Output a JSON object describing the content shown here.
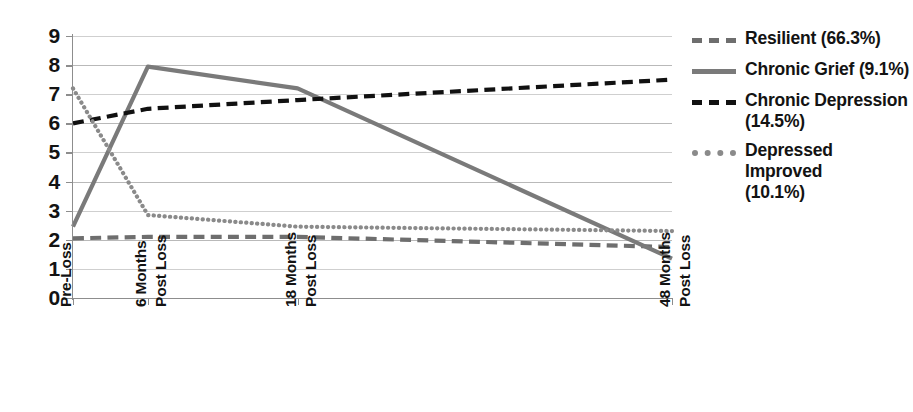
{
  "chart_data": {
    "type": "line",
    "title": "",
    "xlabel": "",
    "ylabel": "",
    "categories": [
      "Pre-Loss",
      "6 Months Post Loss",
      "18 Months Post Loss",
      "48 Months Post Loss"
    ],
    "x": [
      0,
      6,
      18,
      48
    ],
    "xlim": [
      0,
      48
    ],
    "ylim": [
      0,
      9
    ],
    "yticks": [
      "0",
      "1",
      "2",
      "3",
      "4",
      "5",
      "6",
      "7",
      "8",
      "9"
    ],
    "grid": true,
    "legend_position": "right",
    "series": [
      {
        "name": "Resilient (66.3%)",
        "label": "Resilient (66.3%)",
        "style": "dashed",
        "color": "#6e6e6e",
        "values": [
          2.05,
          2.1,
          2.1,
          1.75
        ]
      },
      {
        "name": "Chronic Grief (9.1%)",
        "label": "Chronic Grief (9.1%)",
        "style": "solid",
        "color": "#7a7a7a",
        "values": [
          2.45,
          7.95,
          7.2,
          1.35
        ]
      },
      {
        "name": "Chronic Depression (14.5%)",
        "label": "Chronic Depression (14.5%)",
        "style": "dashed",
        "color": "#111111",
        "values": [
          6.0,
          6.5,
          6.8,
          7.5
        ]
      },
      {
        "name": "Depressed Improved (10.1%)",
        "label": "Depressed Improved (10.1%)",
        "style": "dotted",
        "color": "#8a8a8a",
        "values": [
          7.2,
          2.85,
          2.45,
          2.3
        ]
      }
    ]
  },
  "legend": {
    "entries": [
      {
        "line1": "Resilient (66.3%)",
        "line2": ""
      },
      {
        "line1": "Chronic Grief (9.1%)",
        "line2": ""
      },
      {
        "line1": "Chronic Depression",
        "line2": "(14.5%)"
      },
      {
        "line1": "Depressed Improved",
        "line2": "(10.1%)"
      }
    ]
  },
  "x_axis": {
    "labels": [
      {
        "word1": "Pre-Loss",
        "word2": ""
      },
      {
        "word1": "6 Months",
        "word2": "Post Loss"
      },
      {
        "word1": "18 Months",
        "word2": "Post Loss"
      },
      {
        "word1": "48 Months",
        "word2": "Post Loss"
      }
    ]
  },
  "colors": {
    "axis": "#8d8d8d",
    "grid": "#b9b9b9",
    "text": "#131313",
    "background": "#ffffff"
  }
}
